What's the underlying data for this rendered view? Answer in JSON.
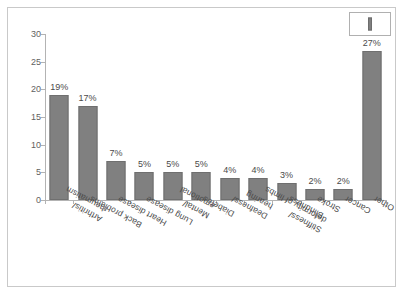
{
  "legend": {
    "swatch_name": "bar-swatch",
    "label": ""
  },
  "chart_data": {
    "type": "bar",
    "title": "",
    "subtitle": "",
    "xlabel": "",
    "ylabel": "",
    "ylim": [
      0,
      30
    ],
    "yticks": [
      0,
      5,
      10,
      15,
      20,
      25,
      30
    ],
    "ytick_labels": [
      "0",
      "5",
      "10",
      "15",
      "20",
      "25",
      "30"
    ],
    "grid": false,
    "legend_position": "top-right",
    "bar_color": "#808080",
    "bar_edge_color": "#6f6f6f",
    "axis_color": "#b3b3b3",
    "categories": [
      "Arthritis/ rheumatism",
      "Back problems",
      "Heart disease",
      "Lung disease",
      "Mental/ emotional",
      "Diabetes",
      "Deafness/ hearing",
      "Stiffness/ deformity of limbs",
      "Blindness",
      "Stroke",
      "Cancer",
      "Other"
    ],
    "category_lines": [
      [
        "Arthritis/",
        "rheumatism"
      ],
      [
        "Back problems"
      ],
      [
        "Heart disease"
      ],
      [
        "Lung disease"
      ],
      [
        "Mental/",
        "emotional"
      ],
      [
        "Diabetes"
      ],
      [
        "Deafness/",
        "hearing"
      ],
      [
        "Stiffness/",
        "deformity of limbs"
      ],
      [
        "Blindness"
      ],
      [
        "Stroke"
      ],
      [
        "Cancer"
      ],
      [
        "Other"
      ]
    ],
    "values": [
      19,
      17,
      7,
      5,
      5,
      5,
      4,
      4,
      3,
      2,
      2,
      27
    ],
    "value_labels": [
      "19%",
      "17%",
      "7%",
      "5%",
      "5%",
      "5%",
      "4%",
      "4%",
      "3%",
      "2%",
      "2%",
      "27%"
    ]
  }
}
